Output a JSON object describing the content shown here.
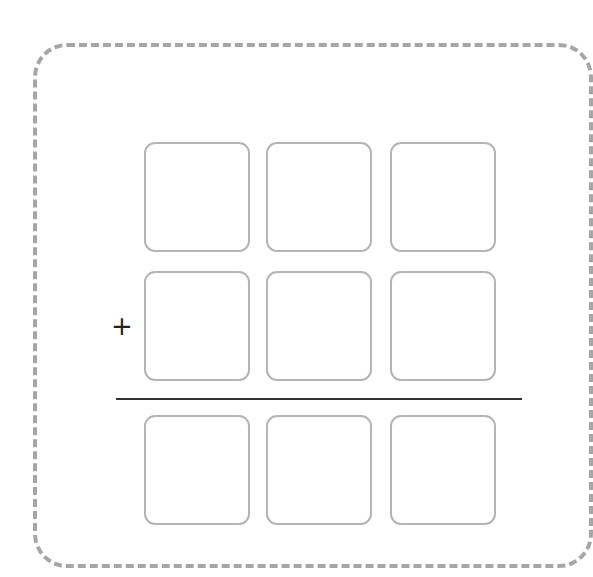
{
  "diagram": {
    "type": "column-addition-worksheet",
    "operator": "+",
    "columns": 3,
    "rows": [
      {
        "role": "addend-1",
        "cells": [
          "",
          "",
          ""
        ]
      },
      {
        "role": "addend-2",
        "cells": [
          "",
          "",
          ""
        ]
      },
      {
        "role": "sum",
        "cells": [
          "",
          "",
          ""
        ]
      }
    ],
    "colors": {
      "outer_border": "#a6a6a6",
      "box_border": "#b5b5b5",
      "divider": "#333333",
      "operator": "#222222"
    }
  }
}
